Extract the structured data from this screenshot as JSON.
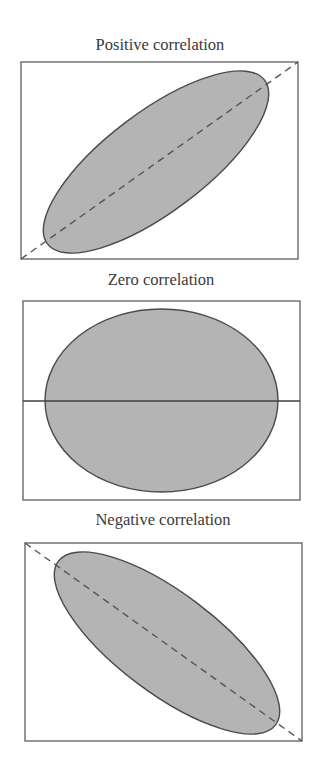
{
  "panels": [
    {
      "title": "Positive correlation",
      "kind": "positive",
      "frame": {
        "x": 21,
        "y": 62,
        "w": 277,
        "h": 197
      },
      "ellipse": {
        "cx": 156,
        "cy": 162,
        "rx": 136,
        "ry": 50,
        "rotate": -37
      },
      "line": {
        "style": "dashed",
        "x1": 21,
        "y1": 259,
        "x2": 298,
        "y2": 62
      }
    },
    {
      "title": "Zero correlation",
      "kind": "zero",
      "frame": {
        "x": 23,
        "y": 301,
        "w": 277,
        "h": 199
      },
      "ellipse": {
        "cx": 161.5,
        "cy": 400.5,
        "rx": 116.5,
        "ry": 91.5,
        "rotate": 0
      },
      "line": {
        "style": "solid",
        "x1": 23,
        "y1": 401,
        "x2": 300,
        "y2": 401
      }
    },
    {
      "title": "Negative correlation",
      "kind": "negative",
      "frame": {
        "x": 25,
        "y": 543,
        "w": 277,
        "h": 198
      },
      "ellipse": {
        "cx": 167,
        "cy": 643,
        "rx": 136,
        "ry": 50,
        "rotate": 37
      },
      "line": {
        "style": "dashed",
        "x1": 25,
        "y1": 543,
        "x2": 302,
        "y2": 741
      }
    }
  ],
  "colors": {
    "fill": "#b4b4b4",
    "outline": "#4a4a4a",
    "frame": "#6a6a6a",
    "text": "#3a3a3a"
  }
}
